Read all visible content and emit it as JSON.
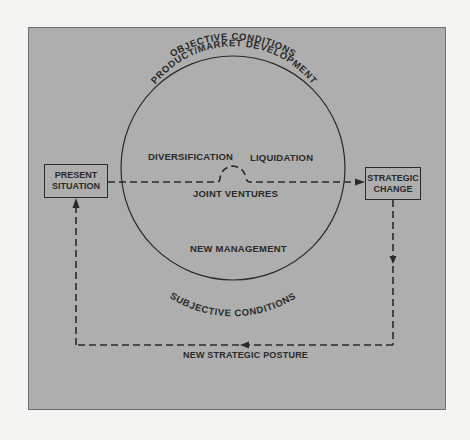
{
  "diagram": {
    "nodes": {
      "present_situation": {
        "line1": "PRESENT",
        "line2": "SITUATION"
      },
      "strategic_change": {
        "line1": "STRATEGIC",
        "line2": "CHANGE"
      }
    },
    "circle": {
      "outer_top_label": "OBJECTIVE CONDITIONS",
      "inner_top_label": "PRODUCT/MARKET DEVELOPMENT",
      "outer_bottom_label": "SUBJECTIVE CONDITIONS",
      "options": {
        "diversification": "DIVERSIFICATION",
        "liquidation": "LIQUIDATION",
        "joint_ventures": "JOINT VENTURES",
        "new_management": "NEW MANAGEMENT"
      }
    },
    "feedback_label": "NEW STRATEGIC POSTURE",
    "colors": {
      "panel_background": "#aeaeae",
      "page_background": "#f4f4f2",
      "ink": "#2a2a2a"
    }
  }
}
